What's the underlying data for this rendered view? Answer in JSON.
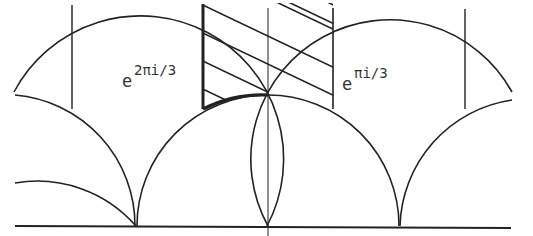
{
  "diagram": {
    "labels": {
      "left_base": "e",
      "left_exp": "2πi/3",
      "right_base": "e",
      "right_exp": "πi/3"
    },
    "colors": {
      "stroke": "#222222",
      "background": "#ffffff"
    },
    "geometry": {
      "baseline_y": 226,
      "cusps_x": [
        136,
        268,
        399
      ],
      "arc_intersections_x": [
        72,
        203,
        333,
        465
      ],
      "intersection_y": 109,
      "shaded_strip_x": [
        203,
        333
      ],
      "center_axis_x": 268
    }
  }
}
